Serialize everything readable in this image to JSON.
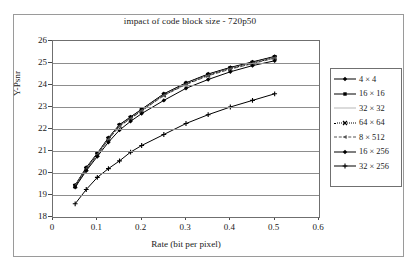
{
  "chart_data": {
    "type": "line",
    "title": "impact of code block size - 720p50",
    "xlabel": "Rate (bit per pixel)",
    "ylabel": "Y-Psnr",
    "xlim": [
      0,
      0.6
    ],
    "ylim": [
      18,
      26
    ],
    "xticks": [
      "0",
      "0.1",
      "0.2",
      "0.3",
      "0.4",
      "0.5",
      "0.6"
    ],
    "yticks": [
      "18",
      "19",
      "20",
      "21",
      "22",
      "23",
      "24",
      "25",
      "26"
    ],
    "xtick_values": [
      0,
      0.1,
      0.2,
      0.3,
      0.4,
      0.5,
      0.6
    ],
    "ytick_values": [
      18,
      19,
      20,
      21,
      22,
      23,
      24,
      25,
      26
    ],
    "grid": "horizontal",
    "legend_position": "right",
    "x": [
      0.05,
      0.075,
      0.1,
      0.125,
      0.15,
      0.175,
      0.2,
      0.25,
      0.3,
      0.35,
      0.4,
      0.45,
      0.5
    ],
    "series": [
      {
        "name": "4 × 4",
        "marker": "diamond",
        "line": "solid",
        "color": "#000000",
        "values": [
          19.45,
          20.25,
          20.9,
          21.6,
          22.2,
          22.55,
          22.9,
          23.6,
          24.1,
          24.5,
          24.8,
          25.05,
          25.3
        ]
      },
      {
        "name": "16 × 16",
        "marker": "square",
        "line": "solid",
        "color": "#000000",
        "values": [
          19.43,
          20.22,
          20.88,
          21.58,
          22.18,
          22.53,
          22.88,
          23.58,
          24.08,
          24.48,
          24.78,
          25.03,
          25.28
        ]
      },
      {
        "name": "32 × 32",
        "marker": "none",
        "line": "solid",
        "color": "#b8b8b8",
        "values": [
          19.42,
          20.2,
          20.86,
          21.56,
          22.16,
          22.51,
          22.86,
          23.56,
          24.06,
          24.46,
          24.76,
          25.01,
          25.26
        ]
      },
      {
        "name": "64 × 64",
        "marker": "cross",
        "line": "dotted",
        "color": "#000000",
        "values": [
          19.4,
          20.18,
          20.84,
          21.54,
          22.14,
          22.49,
          22.84,
          23.54,
          24.04,
          24.44,
          24.74,
          24.99,
          25.24
        ]
      },
      {
        "name": "8 × 512",
        "marker": "triangle",
        "line": "dashed",
        "color": "#555555",
        "values": [
          19.38,
          20.16,
          20.82,
          21.52,
          22.12,
          22.47,
          22.82,
          23.52,
          24.02,
          24.42,
          24.72,
          24.97,
          25.22
        ]
      },
      {
        "name": "16 × 256",
        "marker": "diamond",
        "line": "solid",
        "color": "#000000",
        "values": [
          19.35,
          20.1,
          20.75,
          21.4,
          21.95,
          22.35,
          22.7,
          23.3,
          23.85,
          24.25,
          24.6,
          24.88,
          25.1
        ]
      },
      {
        "name": "32 × 256",
        "marker": "plus",
        "line": "solid",
        "color": "#000000",
        "values": [
          18.6,
          19.25,
          19.8,
          20.2,
          20.55,
          20.95,
          21.25,
          21.75,
          22.25,
          22.65,
          23.0,
          23.3,
          23.6
        ]
      }
    ]
  }
}
